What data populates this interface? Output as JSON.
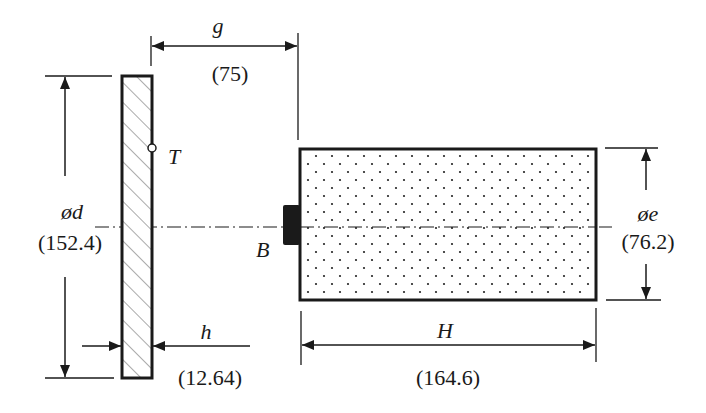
{
  "diagram": {
    "type": "engineering-dimension-drawing",
    "colors": {
      "line": "#1a1a1a",
      "background": "#ffffff"
    },
    "parts": {
      "plate": {
        "name": "hatched plate",
        "fill": "diagonal-hatch"
      },
      "cylinder": {
        "name": "dotted cylinder",
        "fill": "stipple-dots"
      },
      "block": {
        "name": "B",
        "label": "B"
      },
      "marker": {
        "name": "T",
        "label": "T"
      }
    },
    "dimensions": {
      "g": {
        "symbol": "g",
        "value": "(75)"
      },
      "d": {
        "symbol": "ød",
        "value": "(152.4)"
      },
      "e": {
        "symbol": "øe",
        "value": "(76.2)"
      },
      "h": {
        "symbol": "h",
        "value": "(12.64)"
      },
      "H": {
        "symbol": "H",
        "value": "(164.6)"
      }
    }
  }
}
